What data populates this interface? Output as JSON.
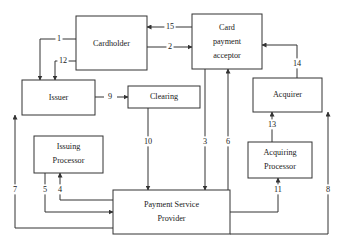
{
  "diagram": {
    "background_color": "#ffffff",
    "line_color": "#333333",
    "text_color": "#1a1a1a",
    "nodes": [
      {
        "id": "cardholder",
        "label": "Cardholder",
        "lines": [
          "Cardholder"
        ],
        "x": 76,
        "y": 16,
        "w": 71,
        "h": 54
      },
      {
        "id": "card-payment-acceptor",
        "label": "Card payment acceptor",
        "lines": [
          "Card",
          "payment",
          "acceptor"
        ],
        "x": 192,
        "y": 14,
        "w": 70,
        "h": 55
      },
      {
        "id": "issuer",
        "label": "Issuer",
        "lines": [
          "Issuer"
        ],
        "x": 22,
        "y": 80,
        "w": 73,
        "h": 35
      },
      {
        "id": "clearing",
        "label": "Clearing",
        "lines": [
          "Clearing"
        ],
        "x": 128,
        "y": 86,
        "w": 72,
        "h": 22
      },
      {
        "id": "acquirer",
        "label": "Acquirer",
        "lines": [
          "Acquirer"
        ],
        "x": 253,
        "y": 78,
        "w": 69,
        "h": 34
      },
      {
        "id": "issuing-processor",
        "label": "Issuing Processor",
        "lines": [
          "Issuing",
          "Processor"
        ],
        "x": 34,
        "y": 136,
        "w": 69,
        "h": 37
      },
      {
        "id": "acquiring-processor",
        "label": "Acquiring Processor",
        "lines": [
          "Acquiring",
          "Processor"
        ],
        "x": 248,
        "y": 142,
        "w": 64,
        "h": 36
      },
      {
        "id": "payment-service-provider",
        "label": "Payment Service Provider",
        "lines": [
          "Payment Service",
          "Provider"
        ],
        "x": 113,
        "y": 190,
        "w": 117,
        "h": 44
      }
    ],
    "edges": [
      {
        "id": "1",
        "label": "1",
        "from": "cardholder",
        "to": "issuer",
        "label_x": 59,
        "label_y": 39
      },
      {
        "id": "2",
        "label": "2",
        "from": "cardholder",
        "to": "card-payment-acceptor",
        "label_x": 170,
        "label_y": 47
      },
      {
        "id": "3",
        "label": "3",
        "from": "card-payment-acceptor",
        "to": "payment-service-provider",
        "label_x": 205,
        "label_y": 142
      },
      {
        "id": "4",
        "label": "4",
        "from": "payment-service-provider",
        "to": "issuing-processor",
        "label_x": 60,
        "label_y": 190
      },
      {
        "id": "5",
        "label": "5",
        "from": "issuing-processor",
        "to": "payment-service-provider",
        "label_x": 45,
        "label_y": 190
      },
      {
        "id": "6",
        "label": "6",
        "from": "payment-service-provider",
        "to": "card-payment-acceptor",
        "label_x": 228,
        "label_y": 142
      },
      {
        "id": "7",
        "label": "7",
        "from": "payment-service-provider",
        "to": "issuer",
        "label_x": 15,
        "label_y": 190
      },
      {
        "id": "8",
        "label": "8",
        "from": "payment-service-provider",
        "to": "acquirer",
        "label_x": 328,
        "label_y": 190
      },
      {
        "id": "9",
        "label": "9",
        "from": "issuer",
        "to": "clearing",
        "label_x": 110,
        "label_y": 97
      },
      {
        "id": "10",
        "label": "10",
        "from": "clearing",
        "to": "payment-service-provider",
        "label_x": 148,
        "label_y": 142
      },
      {
        "id": "11",
        "label": "11",
        "from": "payment-service-provider",
        "to": "acquiring-processor",
        "label_x": 278,
        "label_y": 190
      },
      {
        "id": "12",
        "label": "12",
        "from": "external",
        "to": "issuer",
        "label_x": 63,
        "label_y": 61
      },
      {
        "id": "13",
        "label": "13",
        "from": "acquiring-processor",
        "to": "acquirer",
        "label_x": 272,
        "label_y": 125
      },
      {
        "id": "14",
        "label": "14",
        "from": "acquirer",
        "to": "card-payment-acceptor",
        "label_x": 297,
        "label_y": 64
      },
      {
        "id": "15",
        "label": "15",
        "from": "card-payment-acceptor",
        "to": "cardholder",
        "label_x": 170,
        "label_y": 27
      }
    ]
  }
}
